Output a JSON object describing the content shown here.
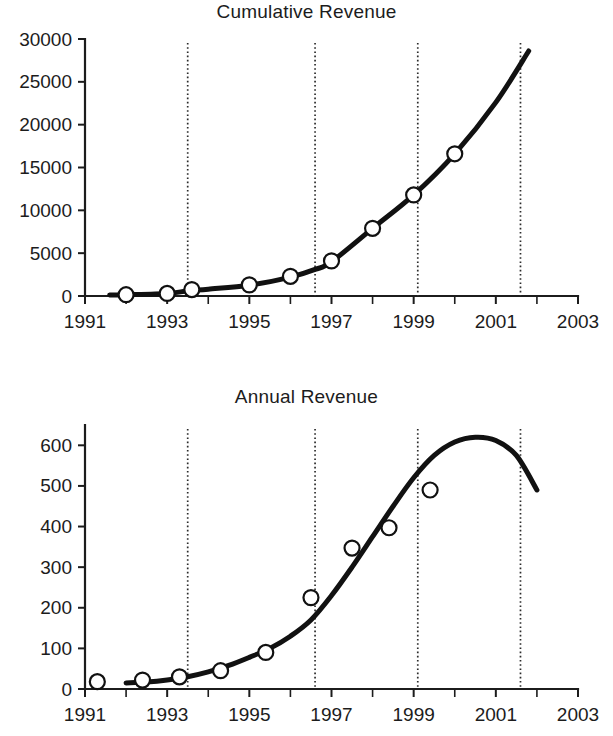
{
  "figure": {
    "background": "#ffffff",
    "ink_color": "#111111",
    "marker_fill": "#ffffff",
    "event_line_color": "#2b2b2b"
  },
  "panels": [
    {
      "id": "cumulative",
      "title": "Cumulative Revenue"
    },
    {
      "id": "annual",
      "title": "Annual Revenue"
    }
  ],
  "chart_data": [
    {
      "type": "line",
      "title": "Cumulative Revenue",
      "xlabel": "",
      "ylabel": "",
      "xlim": [
        1991,
        2003
      ],
      "ylim": [
        0,
        30000
      ],
      "grid": false,
      "legend": "none",
      "xticks": [
        1991,
        1993,
        1995,
        1997,
        1999,
        2001,
        2003
      ],
      "xtick_labels": [
        "1991",
        "1993",
        "1995",
        "1997",
        "1999",
        "2001",
        "2003"
      ],
      "xminor_ticks": [
        1992,
        1994,
        1996,
        1998,
        2000,
        2002
      ],
      "yticks": [
        0,
        5000,
        10000,
        15000,
        20000,
        25000,
        30000
      ],
      "ytick_labels": [
        "0",
        "5000",
        "10000",
        "15000",
        "20000",
        "25000",
        "30000"
      ],
      "annotations": {
        "event_lines_x": [
          1993.5,
          1996.6,
          1999.1,
          2001.6
        ]
      },
      "series": [
        {
          "name": "Cumulative revenue fitted curve",
          "style": "solid-thick-line",
          "x": [
            1991.6,
            1992.0,
            1993.0,
            1993.5,
            1994.0,
            1995.0,
            1996.0,
            1996.6,
            1997.0,
            1998.0,
            1999.0,
            2000.0,
            2001.0,
            2001.8
          ],
          "y": [
            110,
            150,
            300,
            600,
            800,
            1250,
            2200,
            3100,
            4000,
            7900,
            11800,
            16600,
            22600,
            28600
          ]
        },
        {
          "name": "Cumulative revenue observations",
          "style": "open-circle-markers",
          "x": [
            1992.0,
            1993.0,
            1993.6,
            1995.0,
            1996.0,
            1997.0,
            1998.0,
            1999.0,
            2000.0
          ],
          "y": [
            150,
            300,
            750,
            1300,
            2300,
            4100,
            7900,
            11800,
            16600
          ]
        }
      ]
    },
    {
      "type": "line",
      "title": "Annual Revenue",
      "xlabel": "",
      "ylabel": "",
      "xlim": [
        1991,
        2003
      ],
      "ylim": [
        0,
        650
      ],
      "grid": false,
      "legend": "none",
      "xticks": [
        1991,
        1993,
        1995,
        1997,
        1999,
        2001,
        2003
      ],
      "xtick_labels": [
        "1991",
        "1993",
        "1995",
        "1997",
        "1999",
        "2001",
        "2003"
      ],
      "xminor_ticks": [
        1992,
        1994,
        1996,
        1998,
        2000,
        2002
      ],
      "yticks": [
        0,
        100,
        200,
        300,
        400,
        500,
        600
      ],
      "ytick_labels": [
        "0",
        "100",
        "200",
        "300",
        "400",
        "500",
        "600"
      ],
      "annotations": {
        "event_lines_x": [
          1993.5,
          1996.6,
          1999.1,
          2001.6
        ]
      },
      "series": [
        {
          "name": "Annual revenue fitted curve",
          "style": "solid-thick-line",
          "x": [
            1992.0,
            1992.5,
            1993.0,
            1993.5,
            1994.0,
            1994.5,
            1995.0,
            1995.5,
            1996.0,
            1996.5,
            1997.0,
            1997.5,
            1998.0,
            1998.5,
            1999.0,
            1999.5,
            2000.0,
            2000.5,
            2001.0,
            2001.5,
            2002.0
          ],
          "y": [
            15,
            17,
            22,
            30,
            42,
            58,
            78,
            100,
            130,
            170,
            230,
            300,
            375,
            450,
            520,
            575,
            608,
            620,
            612,
            575,
            490
          ]
        },
        {
          "name": "Annual revenue observations",
          "style": "open-circle-markers",
          "x": [
            1991.3,
            1992.4,
            1993.3,
            1994.3,
            1995.4,
            1996.5,
            1997.5,
            1998.4,
            1999.4
          ],
          "y": [
            18,
            22,
            30,
            45,
            90,
            225,
            347,
            397,
            490
          ]
        }
      ]
    }
  ]
}
